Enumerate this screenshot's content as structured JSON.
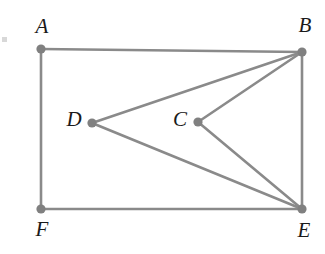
{
  "figure": {
    "canvas": {
      "width": 325,
      "height": 254,
      "background": "#ffffff"
    },
    "style": {
      "edge_color": "#8a8a8a",
      "edge_width": 2.6,
      "vertex_color": "#808080",
      "vertex_radius": 4.6,
      "label_color": "#1a1a1a",
      "label_font_size": 21
    },
    "vertices": [
      {
        "id": "A",
        "label": "A",
        "x": 41,
        "y": 49,
        "label_x": 42,
        "label_y": 28
      },
      {
        "id": "B",
        "label": "B",
        "x": 302,
        "y": 52,
        "label_x": 305,
        "label_y": 27
      },
      {
        "id": "C",
        "label": "C",
        "x": 198,
        "y": 122,
        "label_x": 180,
        "label_y": 121
      },
      {
        "id": "D",
        "label": "D",
        "x": 92,
        "y": 123,
        "label_x": 74,
        "label_y": 121
      },
      {
        "id": "E",
        "label": "E",
        "x": 302,
        "y": 209,
        "label_x": 304,
        "label_y": 232
      },
      {
        "id": "F",
        "label": "F",
        "x": 41,
        "y": 209,
        "label_x": 42,
        "label_y": 231
      }
    ],
    "edges": [
      {
        "id": "A-B",
        "from": "A",
        "to": "B",
        "name": "edge-a-b"
      },
      {
        "id": "B-E",
        "from": "B",
        "to": "E",
        "name": "edge-b-e"
      },
      {
        "id": "E-F",
        "from": "E",
        "to": "F",
        "name": "edge-e-f"
      },
      {
        "id": "F-A",
        "from": "F",
        "to": "A",
        "name": "edge-f-a"
      },
      {
        "id": "D-B",
        "from": "D",
        "to": "B",
        "name": "edge-d-b"
      },
      {
        "id": "D-E",
        "from": "D",
        "to": "E",
        "name": "edge-d-e"
      },
      {
        "id": "C-B",
        "from": "C",
        "to": "B",
        "name": "edge-c-b"
      },
      {
        "id": "C-E",
        "from": "C",
        "to": "E",
        "name": "edge-c-e"
      }
    ],
    "artifact": {
      "x": 2,
      "y": 37,
      "width": 5,
      "height": 5
    }
  }
}
